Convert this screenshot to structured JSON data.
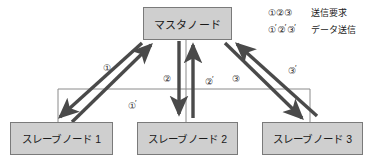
{
  "diagram": {
    "colors": {
      "node_fill": "#cfcfcf",
      "node_border": "#7a7a7a",
      "arrow": "#4a4a4a",
      "bus_line": "#808080",
      "text": "#1a1a1a"
    }
  },
  "nodes": {
    "master": {
      "label": "マスタノード"
    },
    "slaves": [
      {
        "label": "スレーブノード 1"
      },
      {
        "label": "スレーブノード 2"
      },
      {
        "label": "スレーブノード 3"
      }
    ]
  },
  "arrow_labels": {
    "request_1": "①",
    "data_1": "①",
    "request_2": "②",
    "data_2": "②",
    "request_3": "③",
    "data_3": "③"
  },
  "legend": {
    "rows": [
      {
        "symbols": "①②③",
        "text": "送信要求"
      },
      {
        "symbols_primed": [
          "①",
          "②",
          "③"
        ],
        "text": "データ送信"
      }
    ]
  }
}
